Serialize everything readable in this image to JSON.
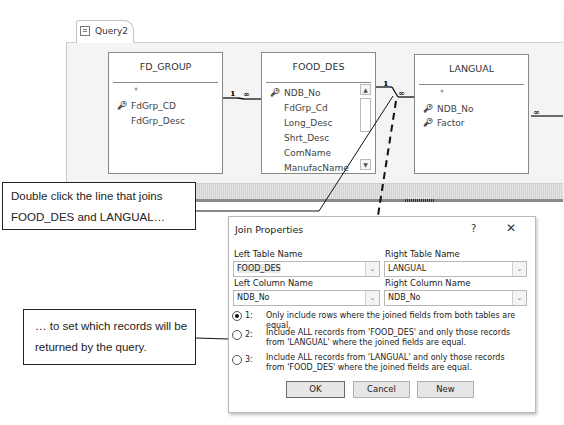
{
  "query_window": {
    "tab_label": "Query2",
    "tab_icon": "query-icon"
  },
  "tables": [
    {
      "name": "FD_GROUP",
      "fields": [
        {
          "label": "*",
          "key": false
        },
        {
          "label": "FdGrp_CD",
          "key": true
        },
        {
          "label": "FdGrp_Desc",
          "key": false
        }
      ]
    },
    {
      "name": "FOOD_DES",
      "fields": [
        {
          "label": "NDB_No",
          "key": true
        },
        {
          "label": "FdGrp_Cd",
          "key": false
        },
        {
          "label": "Long_Desc",
          "key": false
        },
        {
          "label": "Shrt_Desc",
          "key": false
        },
        {
          "label": "ComName",
          "key": false
        },
        {
          "label": "ManufacName",
          "key": false
        }
      ],
      "scrollbar": true
    },
    {
      "name": "LANGUAL",
      "fields": [
        {
          "label": "*",
          "key": false
        },
        {
          "label": "NDB_No",
          "key": true
        },
        {
          "label": "Factor",
          "key": true
        }
      ]
    }
  ],
  "relationships": [
    {
      "from": "FD_GROUP",
      "to": "FOOD_DES",
      "one": "1",
      "many": "∞"
    },
    {
      "from": "FOOD_DES",
      "to": "LANGUAL",
      "one": "1",
      "many": "∞"
    },
    {
      "from": "LANGUAL",
      "to": "offscreen",
      "one": "",
      "many": "∞"
    }
  ],
  "callouts": {
    "top": [
      "Double click the line that joins",
      "FOOD_DES and LANGUAL…"
    ],
    "bottom": [
      "… to set which records will be",
      "returned by the query."
    ]
  },
  "dialog": {
    "title": "Join Properties",
    "help": "?",
    "close": "✕",
    "left_table_label": "Left Table Name",
    "left_table_value": "FOOD_DES",
    "right_table_label": "Right Table Name",
    "right_table_value": "LANGUAL",
    "left_column_label": "Left Column Name",
    "left_column_value": "NDB_No",
    "right_column_label": "Right Column Name",
    "right_column_value": "NDB_No",
    "dropdown_glyph": "⌄",
    "options": [
      {
        "num": "1:",
        "text": "Only include rows where the joined fields from both tables are equal.",
        "selected": true
      },
      {
        "num": "2:",
        "text": "Include ALL records from 'FOOD_DES' and only those records from 'LANGUAL' where the joined fields are equal.",
        "selected": false
      },
      {
        "num": "3:",
        "text": "Include ALL records from 'LANGUAL' and only those records from 'FOOD_DES' where the joined fields are equal.",
        "selected": false
      }
    ],
    "buttons": {
      "ok": "OK",
      "cancel": "Cancel",
      "new": "New"
    }
  }
}
